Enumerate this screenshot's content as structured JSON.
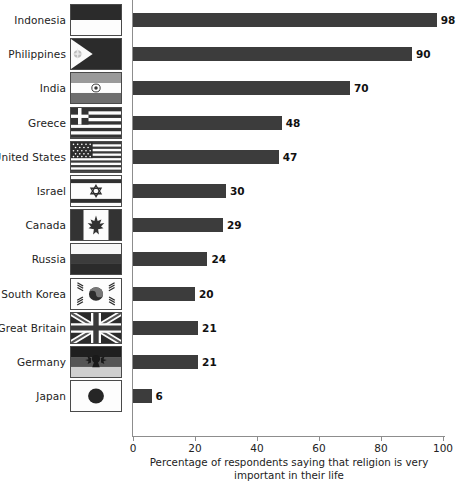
{
  "chart_data": {
    "type": "bar",
    "orientation": "horizontal",
    "title": "",
    "xlabel": "Percentage of respondents saying that religion is very important in their life",
    "ylabel": "",
    "xlim": [
      0,
      105
    ],
    "xticks": [
      0,
      20,
      40,
      60,
      80,
      100
    ],
    "grid": false,
    "legend": null,
    "bar_color": "#3c3c3c",
    "axis_color": "#8d8d8d",
    "categories": [
      "Indonesia",
      "Philippines",
      "India",
      "Greece",
      "United States",
      "Israel",
      "Canada",
      "Russia",
      "South Korea",
      "Great Britain",
      "Germany",
      "Japan"
    ],
    "values": [
      98,
      90,
      70,
      48,
      47,
      30,
      29,
      24,
      20,
      21,
      21,
      6
    ],
    "value_labels": [
      "98",
      "90",
      "70",
      "48",
      "47",
      "30",
      "29",
      "24",
      "20",
      "21",
      "21",
      "6"
    ],
    "bars": [
      {
        "category": "Indonesia",
        "value": 98,
        "label": "98",
        "flag": "indonesia-flag-icon"
      },
      {
        "category": "Philippines",
        "value": 90,
        "label": "90",
        "flag": "philippines-flag-icon"
      },
      {
        "category": "India",
        "value": 70,
        "label": "70",
        "flag": "india-flag-icon"
      },
      {
        "category": "Greece",
        "value": 48,
        "label": "48",
        "flag": "greece-flag-icon"
      },
      {
        "category": "United States",
        "value": 47,
        "label": "47",
        "flag": "united-states-flag-icon"
      },
      {
        "category": "Israel",
        "value": 30,
        "label": "30",
        "flag": "israel-flag-icon"
      },
      {
        "category": "Canada",
        "value": 29,
        "label": "29",
        "flag": "canada-flag-icon"
      },
      {
        "category": "Russia",
        "value": 24,
        "label": "24",
        "flag": "russia-flag-icon"
      },
      {
        "category": "South Korea",
        "value": 20,
        "label": "20",
        "flag": "south-korea-flag-icon"
      },
      {
        "category": "Great Britain",
        "value": 21,
        "label": "21",
        "flag": "great-britain-flag-icon"
      },
      {
        "category": "Germany",
        "value": 21,
        "label": "21",
        "flag": "germany-flag-icon"
      },
      {
        "category": "Japan",
        "value": 6,
        "label": "6",
        "flag": "japan-flag-icon"
      }
    ],
    "xtick_labels": [
      "0",
      "20",
      "40",
      "60",
      "80",
      "100"
    ],
    "xlabel_line1": "Percentage of respondents saying that religion is very",
    "xlabel_line2": "important in their life"
  }
}
